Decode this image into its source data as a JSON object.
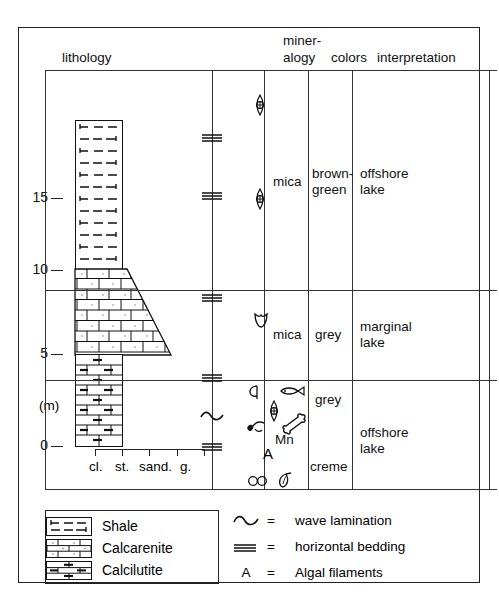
{
  "figure": {
    "headers": {
      "lithology": "lithology",
      "mineralogy_line1": "miner-",
      "mineralogy_line2": "alogy",
      "colors": "colors",
      "interpretation": "interpretation"
    },
    "depth_axis": {
      "unit_label": "(m)",
      "ticks": [
        "15",
        "10",
        "5",
        "0"
      ],
      "tick_values": [
        15,
        10,
        5,
        0
      ]
    },
    "grain_size_axis": {
      "labels": [
        "cl.",
        "st.",
        "sand.",
        "g."
      ],
      "tick_count": 5
    },
    "rows": [
      {
        "mineralogy": "mica",
        "colors": [
          "brown-",
          "green"
        ],
        "interpretation": [
          "offshore",
          "lake"
        ]
      },
      {
        "mineralogy": "mica",
        "colors": [
          "grey"
        ],
        "interpretation": [
          "marginal",
          "lake"
        ]
      },
      {
        "mineralogy": "Mn",
        "colors": [
          "grey",
          "creme"
        ],
        "interpretation": [
          "offshore",
          "lake"
        ]
      }
    ],
    "lithology_units": [
      {
        "name": "Shale",
        "from_m": 10.2,
        "to_m": 18.6,
        "pattern": "shale"
      },
      {
        "name": "Calcarenite",
        "from_m": 5.0,
        "to_m": 10.2,
        "pattern": "calcarenite"
      },
      {
        "name": "Calcilutite",
        "from_m": 0.0,
        "to_m": 5.0,
        "pattern": "calcilutite"
      }
    ],
    "lithology_legend": [
      {
        "label": "Shale",
        "pattern": "shale"
      },
      {
        "label": "Calcarenite",
        "pattern": "calcarenite"
      },
      {
        "label": "Calcilutite",
        "pattern": "calcilutite"
      }
    ],
    "structure_legend": [
      {
        "symbol": "~",
        "equals": "=",
        "label": "wave lamination",
        "icon": "wave-lamination-icon"
      },
      {
        "symbol": "≡",
        "equals": "=",
        "label": "horizontal bedding",
        "icon": "horizontal-bedding-icon"
      },
      {
        "symbol": "A",
        "equals": "=",
        "label": "Algal filaments",
        "icon": "algal-filaments-icon"
      }
    ],
    "sedimentary_structures": [
      {
        "type": "horizontal-bedding",
        "depth_m": 16.4
      },
      {
        "type": "horizontal-bedding",
        "depth_m": 12.6
      },
      {
        "type": "horizontal-bedding",
        "depth_m": 8.0
      },
      {
        "type": "horizontal-bedding",
        "depth_m": 4.2
      },
      {
        "type": "wave-lamination",
        "depth_m": 2.2
      },
      {
        "type": "horizontal-bedding",
        "depth_m": 0.3
      }
    ],
    "fossils": [
      {
        "type": "ostracod",
        "depth_m": 18.1
      },
      {
        "type": "ostracod",
        "depth_m": 14.2
      },
      {
        "type": "bivalve",
        "depth_m": 8.1
      },
      {
        "type": "shell",
        "depth_m": 4.9
      },
      {
        "type": "fish",
        "depth_m": 5.0
      },
      {
        "type": "ostracod",
        "depth_m": 4.1
      },
      {
        "type": "plant-fragment",
        "depth_m": 3.2
      },
      {
        "type": "bone",
        "depth_m": 3.3
      },
      {
        "type": "algal-filaments",
        "depth_m": 1.7
      },
      {
        "type": "ooids",
        "depth_m": 0.5
      },
      {
        "type": "seed",
        "depth_m": 0.5
      }
    ],
    "colors": {
      "line": "#222222",
      "text": "#111111",
      "background": "#ffffff"
    }
  }
}
